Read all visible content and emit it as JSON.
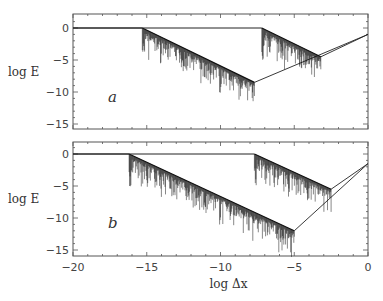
{
  "chart_data": [
    {
      "type": "line",
      "panel_label": "a",
      "xlabel": "log Δx",
      "ylabel": "log E",
      "xlim": [
        -20,
        0
      ],
      "ylim": [
        -15.5,
        2
      ],
      "yticks": [
        "0",
        "-5",
        "-10",
        "-15"
      ],
      "grid": false,
      "series": [
        {
          "name": "curve1",
          "x": [
            -20,
            -15.3,
            -7.7,
            0
          ],
          "y": [
            0,
            0,
            -8.5,
            -1
          ],
          "noisy_segment": [
            -15.3,
            -7.7
          ]
        },
        {
          "name": "curve2",
          "x": [
            -20,
            -7.2,
            -3.2,
            0
          ],
          "y": [
            0,
            0,
            -4.5,
            -1
          ],
          "noisy_segment": [
            -7.2,
            -3.2
          ]
        }
      ]
    },
    {
      "type": "line",
      "panel_label": "b",
      "xlabel": "log Δx",
      "ylabel": "log E",
      "xlim": [
        -20,
        0
      ],
      "ylim": [
        -15.5,
        2
      ],
      "xticks": [
        "-20",
        "-15",
        "-10",
        "-5",
        "0"
      ],
      "yticks": [
        "0",
        "-5",
        "-10",
        "-15"
      ],
      "grid": false,
      "series": [
        {
          "name": "curve1",
          "x": [
            -20,
            -16.2,
            -5,
            0
          ],
          "y": [
            0,
            0,
            -12,
            -1.5
          ],
          "noisy_segment": [
            -16.2,
            -5
          ]
        },
        {
          "name": "curve2",
          "x": [
            -20,
            -7.7,
            -2.5,
            0
          ],
          "y": [
            0,
            0,
            -5.5,
            -1.5
          ],
          "noisy_segment": [
            -7.7,
            -2.5
          ]
        }
      ]
    }
  ],
  "labels": {
    "ylabel": "log E",
    "xlabel": "log Δx",
    "panel_a": "a",
    "panel_b": "b",
    "xticks": [
      "−20",
      "−15",
      "−10",
      "−5",
      "0"
    ],
    "yticks": [
      "0",
      "−5",
      "−10",
      "−15"
    ]
  }
}
